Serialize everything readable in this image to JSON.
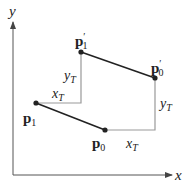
{
  "diagram": {
    "axes": {
      "x_label": "x",
      "y_label": "y",
      "origin": [
        13,
        175
      ],
      "x_end": [
        172,
        175
      ],
      "y_end": [
        13,
        22
      ]
    },
    "points": {
      "p0": {
        "label": "p",
        "sub": "0",
        "prime": "",
        "pos": [
          105,
          130
        ]
      },
      "p1": {
        "label": "p",
        "sub": "1",
        "prime": "",
        "pos": [
          36,
          103
        ]
      },
      "p0_prime": {
        "label": "p",
        "sub": "0",
        "prime": "′",
        "pos": [
          155,
          78
        ]
      },
      "p1_prime": {
        "label": "p",
        "sub": "1",
        "prime": "′",
        "pos": [
          81,
          52
        ]
      }
    },
    "translation_labels": {
      "xT_top": {
        "main": "x",
        "sub": "T"
      },
      "yT_top": {
        "main": "y",
        "sub": "T"
      },
      "xT_bottom": {
        "main": "x",
        "sub": "T"
      },
      "yT_bottom": {
        "main": "y",
        "sub": "T"
      }
    },
    "colors": {
      "axis": "#555555",
      "segment": "#222222",
      "guide": "#999999",
      "point": "#222222"
    }
  }
}
